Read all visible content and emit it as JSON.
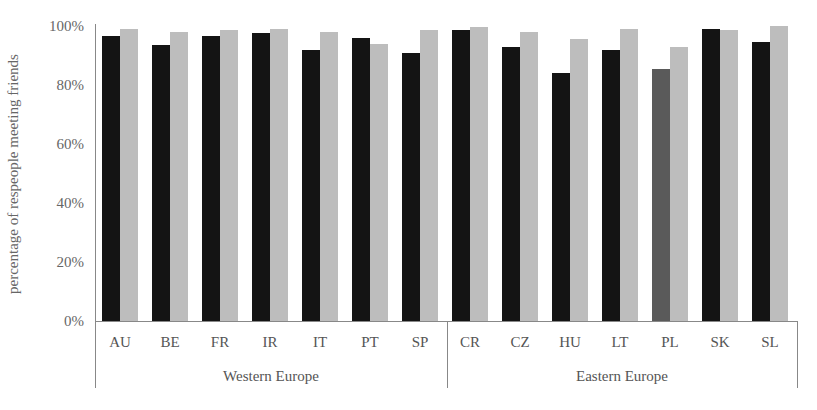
{
  "chart_data": {
    "type": "bar",
    "title": "",
    "xlabel": "",
    "ylabel": "percentage of respeople meeting friends",
    "ylim": [
      0,
      100
    ],
    "yticks": [
      "0%",
      "20%",
      "40%",
      "60%",
      "80%",
      "100%"
    ],
    "grid": false,
    "legend": null,
    "groups": [
      {
        "name": "Western Europe",
        "categories": [
          "AU",
          "BE",
          "FR",
          "IR",
          "IT",
          "PT",
          "SP"
        ]
      },
      {
        "name": "Eastern Europe",
        "categories": [
          "CR",
          "CZ",
          "HU",
          "LT",
          "PL",
          "SK",
          "SL"
        ]
      }
    ],
    "categories": [
      "AU",
      "BE",
      "FR",
      "IR",
      "IT",
      "PT",
      "SP",
      "CR",
      "CZ",
      "HU",
      "LT",
      "PL",
      "SK",
      "SL"
    ],
    "series": [
      {
        "name": "series 1 (dark)",
        "values": [
          96.5,
          93.5,
          96.5,
          97.5,
          92,
          96,
          91,
          98.5,
          93,
          84,
          92,
          85.5,
          99,
          94.5
        ]
      },
      {
        "name": "series 2 (light)",
        "values": [
          99,
          98,
          98.5,
          99,
          98,
          94,
          98.5,
          99.5,
          98,
          95.5,
          99,
          93,
          98.5,
          100
        ]
      }
    ],
    "colors": {
      "series1": "#141414",
      "series1_highlight": "#5a5a5a",
      "series2": "#bdbdbd"
    },
    "highlight_category": "PL"
  },
  "labels": {
    "ylabel": "percentage of respeople meeting friends",
    "yticks": [
      "0%",
      "20%",
      "40%",
      "60%",
      "80%",
      "100%"
    ],
    "groups": [
      "Western Europe",
      "Eastern Europe"
    ]
  }
}
